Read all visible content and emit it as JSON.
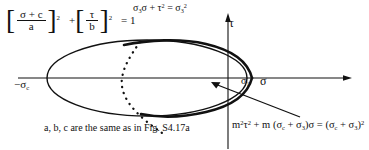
{
  "figure": {
    "background": "#ffffff",
    "ink": "#111111",
    "width": 369,
    "height": 150
  },
  "axes": {
    "horizontal_label": "σ",
    "vertical_label": "τ",
    "origin_px": [
      228,
      78
    ],
    "x_axis_from_px": [
      18,
      78
    ],
    "x_axis_to_px": [
      352,
      78
    ],
    "y_axis_from_px": [
      228,
      148
    ],
    "y_axis_to_px": [
      228,
      14
    ],
    "ticks": [
      {
        "name": "neg-sigma-c",
        "label_parts": {
          "minus": "−",
          "sym": "σ",
          "sub": "c"
        },
        "x_px": 47
      },
      {
        "name": "sigma-1",
        "label_parts": {
          "sym": "σ",
          "sub": "1"
        },
        "x_px": 247
      }
    ]
  },
  "equations": {
    "ellipse": {
      "name": "griffith-ellipse-equation",
      "numerator": "σ + c",
      "denominator": "a",
      "power_first": "2",
      "plus": "+",
      "numerator2": "τ",
      "denominator2": "b",
      "power_second": "2",
      "tail": "= 1"
    },
    "parabola": {
      "name": "parabola-equation",
      "text": "σ₃σ + τ² = σ₃²",
      "parts": {
        "s3": "σ",
        "s3sub": "3",
        "sigma": "σ",
        "plus": "+",
        "tau": "τ",
        "tausup": "2",
        "eq": "=",
        "rhs": "σ",
        "rhssub": "3",
        "rhssup": "2"
      }
    },
    "modified": {
      "name": "modified-criterion-equation",
      "text": "m²τ² + m (σc + σ3)σ = (σc + σ3)²",
      "parts": {
        "m": "m",
        "msup": "2",
        "tau": "τ",
        "tausup": "2",
        "plus": "+",
        "m2": "m",
        "open": "(",
        "sc": "σ",
        "scsub": "c",
        "plus2": "+",
        "s3": "σ",
        "s3sub": "3",
        "close": ")",
        "sigma": "σ",
        "eq": "=",
        "open2": "(",
        "sc2": "σ",
        "scsub2": "c",
        "plus3": "+",
        "s32": "σ",
        "s3sub2": "3",
        "close2": ")",
        "rhssup": "2"
      }
    }
  },
  "note": {
    "name": "reference-note",
    "text": "a, b, c are the same as in Fig. S4.17a"
  },
  "curves": {
    "ellipse": {
      "name": "griffith-ellipse",
      "type": "ellipse",
      "cx_px": 147,
      "cy_px": 78,
      "rx_px": 100,
      "ry_px": 38,
      "stroke_width": 1.4
    },
    "inner_envelope": {
      "name": "modified-envelope-curve",
      "type": "open-curve",
      "stroke_width": 2.6,
      "left_vertex_px": [
        252,
        78
      ],
      "comment": "thick curve tangent inside the ellipse, opening to the left"
    },
    "parabola_dotted": {
      "name": "parabola-dotted-curve",
      "type": "dotted",
      "stroke_width": 2.0,
      "dash": "0.2 6"
    },
    "leader": {
      "name": "leader-line-to-envelope",
      "from_px": [
        300,
        118
      ],
      "to_px": [
        214,
        84
      ],
      "arrow": true
    }
  }
}
